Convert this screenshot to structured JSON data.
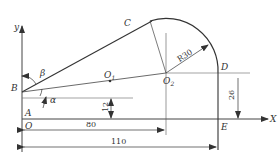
{
  "diagram": {
    "axes": {
      "x_label": "X",
      "y_label": "y"
    },
    "points": {
      "A": "A",
      "B": "B",
      "C": "C",
      "D": "D",
      "E": "E",
      "O": "O",
      "O1": "O",
      "O1_sub": "1",
      "O2": "O",
      "O2_sub": "2"
    },
    "angles": {
      "alpha": "α",
      "beta": "β"
    },
    "dimensions": {
      "radius": "R30",
      "offset_12": "12",
      "height_26": "26",
      "length_80": "80",
      "length_110": "110"
    },
    "colors": {
      "line": "#333333",
      "background": "#ffffff"
    }
  }
}
